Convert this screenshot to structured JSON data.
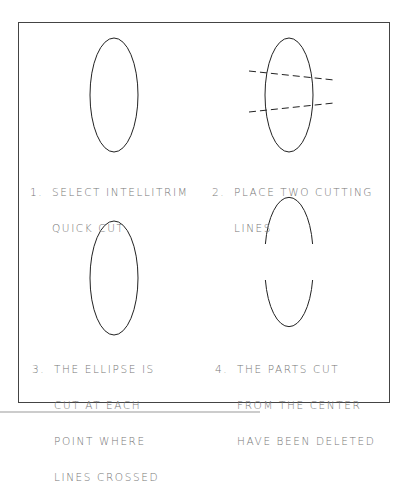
{
  "steps": [
    {
      "number": "1.",
      "lines": [
        "SELECT INTELLITRIM",
        "QUICK CUT"
      ]
    },
    {
      "number": "2.",
      "lines": [
        "PLACE TWO CUTTING",
        "LINES"
      ]
    },
    {
      "number": "3.",
      "lines": [
        "THE ELLIPSE IS",
        "CUT AT EACH",
        "POINT WHERE",
        "LINES CROSSED"
      ]
    },
    {
      "number": "4.",
      "lines": [
        "THE PARTS CUT",
        "FROM THE CENTER",
        "HAVE BEEN DELETED"
      ]
    }
  ],
  "colors": {
    "stroke": "#222222",
    "text": "#777777",
    "frame": "#444444"
  }
}
